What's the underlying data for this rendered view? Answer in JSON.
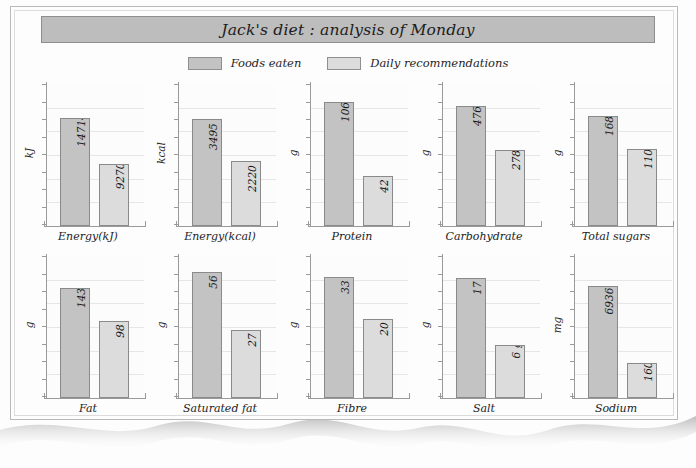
{
  "figure": {
    "title": "Jack's diet : analysis of Monday",
    "legend": [
      {
        "label": "Foods eaten",
        "color": "#c3c3c3"
      },
      {
        "label": "Daily recommendations",
        "color": "#dcdcdc"
      }
    ]
  },
  "chart_data": {
    "type": "bar",
    "title": "Jack's diet : analysis of Monday",
    "xlabel": "",
    "ylabel": "",
    "grid": true,
    "legend_position": "top",
    "legend_entries": [
      "Foods eaten",
      "Daily recommendations"
    ],
    "categories": [
      "Energy(kJ)",
      "Energy(kcal)",
      "Protein",
      "Carbohydrate",
      "Total sugars",
      "Fat",
      "Saturated fat",
      "Fibre",
      "Salt",
      "Sodium"
    ],
    "series": [
      {
        "name": "Foods eaten",
        "values": [
          14714,
          3495,
          106,
          476,
          168,
          143,
          56,
          33,
          17,
          6936
        ]
      },
      {
        "name": "Daily recommendations",
        "values": [
          9270,
          2220,
          42,
          278,
          110,
          98,
          27,
          20,
          6,
          1600
        ]
      }
    ],
    "panels": [
      {
        "category": "Energy(kJ)",
        "unit": "kJ",
        "ylim": [
          0,
          17000
        ],
        "ticks": 9,
        "bars": [
          {
            "series": "Foods eaten",
            "value": 14714,
            "label": "14714 kJ",
            "frac": 0.762
          },
          {
            "series": "Daily recommendations",
            "value": 9270,
            "label": "9270 kJ",
            "frac": 0.438
          }
        ]
      },
      {
        "category": "Energy(kcal)",
        "unit": "kcal",
        "ylim": [
          0,
          4000
        ],
        "ticks": 9,
        "bars": [
          {
            "series": "Foods eaten",
            "value": 3495,
            "label": "3495 kcal",
            "frac": 0.755
          },
          {
            "series": "Daily recommendations",
            "value": 2220,
            "label": "2220 kcal",
            "frac": 0.455
          }
        ]
      },
      {
        "category": "Protein",
        "unit": "g",
        "ylim": [
          0,
          120
        ],
        "ticks": 9,
        "bars": [
          {
            "series": "Foods eaten",
            "value": 106,
            "label": "106 g",
            "frac": 0.876
          },
          {
            "series": "Daily recommendations",
            "value": 42,
            "label": "42 g",
            "frac": 0.355
          }
        ]
      },
      {
        "category": "Carbohydrate",
        "unit": "g",
        "ylim": [
          0,
          560
        ],
        "ticks": 9,
        "bars": [
          {
            "series": "Foods eaten",
            "value": 476,
            "label": "476 g",
            "frac": 0.845
          },
          {
            "series": "Daily recommendations",
            "value": 278,
            "label": "278 g",
            "frac": 0.537
          }
        ]
      },
      {
        "category": "Total sugars",
        "unit": "g",
        "ylim": [
          0,
          200
        ],
        "ticks": 9,
        "bars": [
          {
            "series": "Foods eaten",
            "value": 168,
            "label": "168 g",
            "frac": 0.775
          },
          {
            "series": "Daily recommendations",
            "value": 110,
            "label": "110 g",
            "frac": 0.545
          }
        ]
      },
      {
        "category": "Fat",
        "unit": "g",
        "ylim": [
          0,
          180
        ],
        "ticks": 9,
        "bars": [
          {
            "series": "Foods eaten",
            "value": 143,
            "label": "143 g",
            "frac": 0.775
          },
          {
            "series": "Daily recommendations",
            "value": 98,
            "label": "98 g",
            "frac": 0.545
          }
        ]
      },
      {
        "category": "Saturated fat",
        "unit": "g",
        "ylim": [
          0,
          60
        ],
        "ticks": 9,
        "bars": [
          {
            "series": "Foods eaten",
            "value": 56,
            "label": "56 g",
            "frac": 0.885
          },
          {
            "series": "Daily recommendations",
            "value": 27,
            "label": "27 g",
            "frac": 0.478
          }
        ]
      },
      {
        "category": "Fibre",
        "unit": "g",
        "ylim": [
          0,
          36
        ],
        "ticks": 9,
        "bars": [
          {
            "series": "Foods eaten",
            "value": 33,
            "label": "33 g",
            "frac": 0.855
          },
          {
            "series": "Daily recommendations",
            "value": 20,
            "label": "20 g",
            "frac": 0.555
          }
        ]
      },
      {
        "category": "Salt",
        "unit": "g",
        "ylim": [
          0,
          20
        ],
        "ticks": 9,
        "bars": [
          {
            "series": "Foods eaten",
            "value": 17,
            "label": "17 g",
            "frac": 0.845
          },
          {
            "series": "Daily recommendations",
            "value": 6,
            "label": "6 g",
            "frac": 0.37
          }
        ]
      },
      {
        "category": "Sodium",
        "unit": "mg",
        "ylim": [
          0,
          9000
        ],
        "ticks": 9,
        "bars": [
          {
            "series": "Foods eaten",
            "value": 6936,
            "label": "6936 mg",
            "frac": 0.79
          },
          {
            "series": "Daily recommendations",
            "value": 1600,
            "label": "1600 mg",
            "frac": 0.245
          }
        ]
      }
    ]
  }
}
